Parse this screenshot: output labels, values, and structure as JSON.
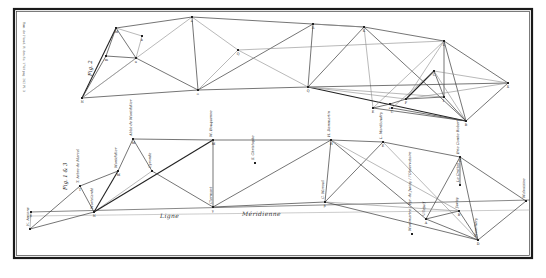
{
  "plate": {
    "margin_note": "Tom. de l'Acad. R. des Sc. 1740 pag. 262 Pl. 3",
    "frame": {
      "x": 14,
      "y": 9,
      "w": 518,
      "h": 249
    }
  },
  "figure_upper": {
    "caption": "Fig. 2",
    "nodes": [
      {
        "id": "N",
        "x": 82,
        "y": 98,
        "letter": "N"
      },
      {
        "id": "M",
        "x": 116,
        "y": 28,
        "letter": "M"
      },
      {
        "id": "m",
        "x": 106,
        "y": 56,
        "letter": "m"
      },
      {
        "id": "u",
        "x": 136,
        "y": 58,
        "letter": "u"
      },
      {
        "id": "k",
        "x": 142,
        "y": 36,
        "letter": "k"
      },
      {
        "id": "A",
        "x": 192,
        "y": 17,
        "letter": "a"
      },
      {
        "id": "O",
        "x": 198,
        "y": 90,
        "letter": "o"
      },
      {
        "id": "Q",
        "x": 238,
        "y": 50,
        "letter": "Q"
      },
      {
        "id": "R",
        "x": 313,
        "y": 24,
        "letter": "R"
      },
      {
        "id": "P",
        "x": 308,
        "y": 87,
        "letter": "Q"
      },
      {
        "id": "K",
        "x": 364,
        "y": 27,
        "letter": "K"
      },
      {
        "id": "L",
        "x": 444,
        "y": 41,
        "letter": "L"
      },
      {
        "id": "H",
        "x": 434,
        "y": 71,
        "letter": "G"
      },
      {
        "id": "X",
        "x": 508,
        "y": 83,
        "letter": "X"
      },
      {
        "id": "I",
        "x": 444,
        "y": 97,
        "letter": "I"
      },
      {
        "id": "F",
        "x": 406,
        "y": 99,
        "letter": "F"
      },
      {
        "id": "E",
        "x": 373,
        "y": 108,
        "letter": "E"
      },
      {
        "id": "D",
        "x": 390,
        "y": 104,
        "letter": "e"
      },
      {
        "id": "C",
        "x": 392,
        "y": 108,
        "letter": "C"
      },
      {
        "id": "B",
        "x": 466,
        "y": 121,
        "letter": "B"
      }
    ],
    "edges": [
      [
        "N",
        "M",
        "heavy"
      ],
      [
        "N",
        "O",
        ""
      ],
      [
        "N",
        "u",
        "light"
      ],
      [
        "N",
        "m",
        ""
      ],
      [
        "M",
        "A",
        ""
      ],
      [
        "M",
        "u",
        ""
      ],
      [
        "M",
        "m",
        ""
      ],
      [
        "M",
        "k",
        "light"
      ],
      [
        "m",
        "u",
        ""
      ],
      [
        "u",
        "k",
        "light"
      ],
      [
        "u",
        "O",
        ""
      ],
      [
        "A",
        "O",
        ""
      ],
      [
        "A",
        "K",
        ""
      ],
      [
        "A",
        "Q",
        "light"
      ],
      [
        "N",
        "A",
        "light"
      ],
      [
        "O",
        "R",
        ""
      ],
      [
        "O",
        "P",
        ""
      ],
      [
        "O",
        "Q",
        "light"
      ],
      [
        "Q",
        "P",
        "light"
      ],
      [
        "Q",
        "L",
        "light"
      ],
      [
        "R",
        "P",
        ""
      ],
      [
        "R",
        "K",
        "light"
      ],
      [
        "P",
        "K",
        ""
      ],
      [
        "K",
        "L",
        ""
      ],
      [
        "K",
        "B",
        ""
      ],
      [
        "K",
        "E",
        "light"
      ],
      [
        "P",
        "X",
        ""
      ],
      [
        "P",
        "B",
        "heavy"
      ],
      [
        "P",
        "F",
        "light"
      ],
      [
        "P",
        "I",
        "light"
      ],
      [
        "L",
        "X",
        ""
      ],
      [
        "L",
        "B",
        ""
      ],
      [
        "L",
        "I",
        ""
      ],
      [
        "L",
        "E",
        "light"
      ],
      [
        "L",
        "F",
        "light"
      ],
      [
        "X",
        "B",
        ""
      ],
      [
        "X",
        "F",
        "light"
      ],
      [
        "X",
        "H",
        "light"
      ],
      [
        "H",
        "I",
        ""
      ],
      [
        "H",
        "F",
        "heavy"
      ],
      [
        "H",
        "B",
        "light"
      ],
      [
        "H",
        "C",
        "light"
      ],
      [
        "I",
        "B",
        ""
      ],
      [
        "F",
        "I",
        ""
      ],
      [
        "E",
        "B",
        ""
      ],
      [
        "C",
        "B",
        ""
      ],
      [
        "D",
        "F",
        ""
      ],
      [
        "E",
        "D",
        ""
      ]
    ]
  },
  "figure_lower": {
    "caption": "Fig. 1 & 3",
    "meridian_label_1": "Ligne",
    "meridian_label_2": "Méridienne",
    "meridian": {
      "x1": 30,
      "y1": 212,
      "x2": 530,
      "y2": 200
    },
    "meridian2": {
      "x1": 30,
      "y1": 216,
      "x2": 530,
      "y2": 210
    },
    "nodes": [
      {
        "id": "Am",
        "x": 30,
        "y": 229,
        "letter": "",
        "label": "N. Amiens"
      },
      {
        "id": "beta",
        "x": 31,
        "y": 212,
        "letter": "β",
        "label": ""
      },
      {
        "id": "T",
        "x": 80,
        "y": 186,
        "letter": "T",
        "label": "T. Arbre de Marcel"
      },
      {
        "id": "Nv",
        "x": 94,
        "y": 212,
        "letter": "N",
        "label": "Mortelandé"
      },
      {
        "id": "Mt",
        "x": 118,
        "y": 171,
        "letter": "M",
        "label": "Montdidier"
      },
      {
        "id": "Ab",
        "x": 133,
        "y": 139,
        "letter": "M",
        "label": "Abbé de Montdidier"
      },
      {
        "id": "Gu",
        "x": 152,
        "y": 171,
        "letter": "",
        "label": "Cyronde"
      },
      {
        "id": "Cl",
        "x": 213,
        "y": 207,
        "letter": "γ",
        "label": "Clermont"
      },
      {
        "id": "Bd",
        "x": 213,
        "y": 140,
        "letter": "M",
        "label": "M. Bouquenne"
      },
      {
        "id": "Ch",
        "x": 255,
        "y": 163,
        "letter": "",
        "label": "S. Christophe"
      },
      {
        "id": "Mr",
        "x": 325,
        "y": 202,
        "letter": "β",
        "label": "C. Mareuil"
      },
      {
        "id": "Dm",
        "x": 331,
        "y": 140,
        "letter": "H",
        "label": "H. Dammartin"
      },
      {
        "id": "Mb",
        "x": 383,
        "y": 142,
        "letter": "E",
        "label": "L. Montbaudry"
      },
      {
        "id": "Br",
        "x": 460,
        "y": 157,
        "letter": "C",
        "label": "Brie Comte Robert"
      },
      {
        "id": "Cr",
        "x": 460,
        "y": 185,
        "letter": "",
        "label": "Le Crottes"
      },
      {
        "id": "Mo",
        "x": 526,
        "y": 201,
        "letter": "",
        "label": "Malvoisine"
      },
      {
        "id": "Vl",
        "x": 426,
        "y": 219,
        "letter": "A",
        "label": "Villejuif"
      },
      {
        "id": "Ju",
        "x": 459,
        "y": 211,
        "letter": "B",
        "label": "Juvisy"
      },
      {
        "id": "Mh",
        "x": 478,
        "y": 240,
        "letter": "D",
        "label": "Montlhéry"
      },
      {
        "id": "Lb",
        "x": 412,
        "y": 234,
        "letter": "",
        "label": "Montmartre / Pyr. de Juvisy / l'Observatoire"
      }
    ],
    "edges": [
      [
        "Am",
        "Nv",
        ""
      ],
      [
        "Am",
        "T",
        ""
      ],
      [
        "Am",
        "beta",
        "light"
      ],
      [
        "T",
        "Nv",
        ""
      ],
      [
        "T",
        "Mt",
        ""
      ],
      [
        "Nv",
        "Mt",
        "heavy"
      ],
      [
        "Mt",
        "Ab",
        ""
      ],
      [
        "Ab",
        "Gu",
        ""
      ],
      [
        "Ab",
        "Bd",
        ""
      ],
      [
        "Nv",
        "Gu",
        "light"
      ],
      [
        "Nv",
        "Bd",
        "heavy"
      ],
      [
        "Gu",
        "Cl",
        ""
      ],
      [
        "Bd",
        "Cl",
        ""
      ],
      [
        "Cl",
        "Dm",
        ""
      ],
      [
        "Bd",
        "Dm",
        ""
      ],
      [
        "Cl",
        "Mr",
        ""
      ],
      [
        "Dm",
        "Mr",
        ""
      ],
      [
        "Dm",
        "Mb",
        ""
      ],
      [
        "Mr",
        "Mb",
        ""
      ],
      [
        "Mb",
        "Br",
        ""
      ],
      [
        "Dm",
        "Vl",
        ""
      ],
      [
        "Mr",
        "Mh",
        ""
      ],
      [
        "Mb",
        "Mh",
        "light"
      ],
      [
        "Br",
        "Mo",
        ""
      ],
      [
        "Br",
        "Vl",
        ""
      ],
      [
        "Br",
        "Mh",
        ""
      ],
      [
        "Br",
        "Cr",
        ""
      ],
      [
        "Mo",
        "Mh",
        ""
      ],
      [
        "Vl",
        "Ju",
        ""
      ],
      [
        "Vl",
        "Mh",
        ""
      ],
      [
        "Ju",
        "Mh",
        ""
      ],
      [
        "Mr",
        "Ju",
        "light"
      ],
      [
        "Dm",
        "Ju",
        "light"
      ]
    ]
  }
}
